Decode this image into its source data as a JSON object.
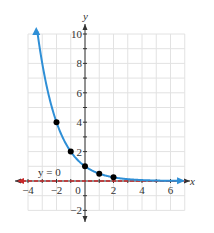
{
  "chart_data": {
    "type": "line",
    "title": "",
    "function": "f(x) = (1/2)^x",
    "xlabel": "x",
    "ylabel": "y",
    "xlim": [
      -4,
      7
    ],
    "ylim": [
      -2,
      10
    ],
    "grid": true,
    "x_ticks": [
      -4,
      -2,
      0,
      2,
      4,
      6
    ],
    "y_ticks": [
      -2,
      2,
      4,
      6,
      8,
      10
    ],
    "x_tick_labels": [
      "−4",
      "−2",
      "0",
      "2",
      "4",
      "6"
    ],
    "y_tick_labels": [
      "−2",
      "2",
      "4",
      "6",
      "8",
      "10"
    ],
    "series": [
      {
        "name": "curve",
        "color": "#2f8fd6",
        "points": [
          [
            -2,
            4
          ],
          [
            -1,
            2
          ],
          [
            0,
            1
          ],
          [
            1,
            0.5
          ],
          [
            2,
            0.25
          ]
        ]
      }
    ],
    "asymptote": {
      "label": "y = 0",
      "color": "#c8282a",
      "style": "dashed"
    }
  },
  "labels": {
    "x_axis": "x",
    "y_axis": "y",
    "asymptote": "y = 0",
    "zero": "0"
  }
}
